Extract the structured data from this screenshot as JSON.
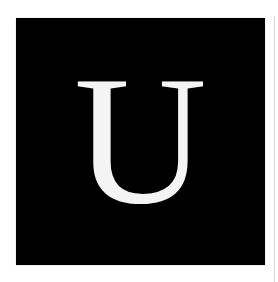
{
  "tile": {
    "letter": "U",
    "background_color": "#000000",
    "letter_color": "#f4f4f4"
  }
}
